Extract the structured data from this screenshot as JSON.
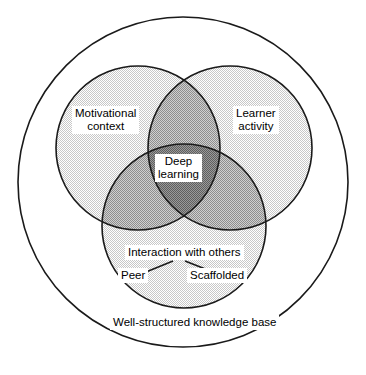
{
  "diagram": {
    "title_visible": false,
    "type": "venn-3-circle-with-enclosing-circle",
    "colors": {
      "stroke": "#1a1a1a",
      "background": "#ffffff",
      "fill_single": "#e2e2e2",
      "fill_double": "#bdbdbd",
      "fill_triple": "#8f8f8f",
      "label_background": "#ffffff",
      "label_text": "#000000"
    },
    "outer_circle": {
      "label": "Well-structured knowledge base",
      "cx": 183,
      "cy": 182,
      "r": 165
    },
    "circles": [
      {
        "name": "motivational-context",
        "label": "Motivational\ncontext",
        "label_line1": "Motivational",
        "label_line2": "context",
        "cx": 138,
        "cy": 148,
        "r": 82
      },
      {
        "name": "learner-activity",
        "label": "Learner\nactivity",
        "label_line1": "Learner",
        "label_line2": "activity",
        "cx": 230,
        "cy": 148,
        "r": 82
      },
      {
        "name": "interaction-with-others",
        "label": "Interaction with others",
        "cx": 184,
        "cy": 226,
        "r": 82
      }
    ],
    "intersection": {
      "name": "deep-learning",
      "label": "Deep\nlearning",
      "label_line1": "Deep",
      "label_line2": "learning"
    },
    "sub_labels": [
      {
        "name": "peer",
        "label": "Peer"
      },
      {
        "name": "scaffolded",
        "label": "Scaffolded"
      }
    ],
    "connectors": [
      {
        "name": "connector-to-peer",
        "from": [
          172,
          262
        ],
        "to": [
          145,
          273
        ]
      },
      {
        "name": "connector-to-scaffolded",
        "from": [
          186,
          262
        ],
        "to": [
          215,
          273
        ]
      }
    ]
  }
}
